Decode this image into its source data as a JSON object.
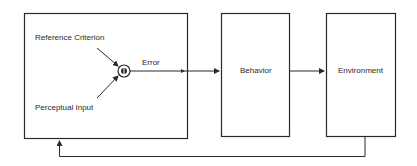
{
  "diagram": {
    "type": "control-loop block diagram",
    "controller_box": {
      "inputs": [
        "Reference Criterion",
        "Perceptual Input"
      ],
      "comparator": "comparator-circle",
      "output_label": "Error"
    },
    "blocks": [
      {
        "id": "behavior",
        "label": "Behavior"
      },
      {
        "id": "environment",
        "label": "Environment"
      }
    ],
    "edges": [
      {
        "from": "comparator",
        "to": "behavior",
        "label": "Error"
      },
      {
        "from": "behavior",
        "to": "environment",
        "label": ""
      },
      {
        "from": "environment",
        "to": "controller_box",
        "label": "",
        "kind": "feedback"
      }
    ],
    "colors": {
      "stroke": "#2a2a2a",
      "background": "#ffffff"
    }
  }
}
